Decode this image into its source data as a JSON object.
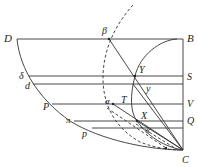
{
  "figure": {
    "type": "geometric-diagram",
    "labels": {
      "D": "D",
      "B": "B",
      "beta": "β",
      "delta": "δ",
      "d": "d",
      "S": "S",
      "Y": "Y",
      "y": "y",
      "P": "P",
      "V": "V",
      "T": "T",
      "alpha": "α",
      "X": "X",
      "x": "x",
      "Q": "Q",
      "pi": "π",
      "p": "p",
      "C": "C"
    }
  }
}
